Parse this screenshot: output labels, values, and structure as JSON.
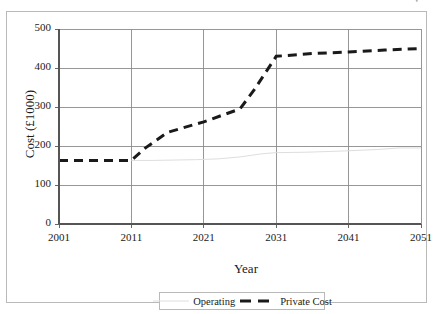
{
  "figure": {
    "caption_remnant": "y",
    "background_color": "#ffffff",
    "frame_color": "#b9b9b9"
  },
  "chart_data": {
    "type": "line",
    "title": "",
    "xlabel": "Year",
    "ylabel": "Cost (£1000)",
    "xlim": [
      2001,
      2051
    ],
    "ylim": [
      0,
      500
    ],
    "xticks": [
      2001,
      2011,
      2021,
      2031,
      2041,
      2051
    ],
    "yticks": [
      0,
      100,
      200,
      300,
      400,
      500
    ],
    "xtick_labels": [
      "2001",
      "2011",
      "2021",
      "2031",
      "2041",
      "2051"
    ],
    "ytick_labels": [
      "0",
      "100",
      "200",
      "300",
      "400",
      "500"
    ],
    "grid": true,
    "grid_color": "#8c8c8c",
    "legend_position": "bottom",
    "series": [
      {
        "name": "Operating",
        "color": "#dedede",
        "style": "solid",
        "width": 1,
        "x": [
          2011,
          2014,
          2017,
          2020,
          2023,
          2026,
          2029,
          2031,
          2035,
          2040,
          2045,
          2048,
          2051
        ],
        "values": [
          163,
          163,
          164,
          165,
          167,
          172,
          180,
          183,
          184,
          187,
          191,
          195,
          195
        ]
      },
      {
        "name": "Private Cost",
        "color": "#1a1a1a",
        "style": "dashed",
        "width": 3,
        "x": [
          2001,
          2011,
          2013,
          2016,
          2021,
          2026,
          2028,
          2031,
          2036,
          2041,
          2046,
          2051
        ],
        "values": [
          163,
          163,
          196,
          235,
          262,
          295,
          345,
          430,
          437,
          441,
          446,
          450
        ]
      }
    ]
  },
  "legend": {
    "items": [
      {
        "label": "Operating",
        "swatch": "thin-gray-line-swatch"
      },
      {
        "label": "Private Cost",
        "swatch": "thick-black-dashed-swatch"
      }
    ]
  }
}
